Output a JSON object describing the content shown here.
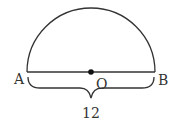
{
  "diagram": {
    "type": "semicircle",
    "labels": {
      "left_endpoint": "A",
      "right_endpoint": "B",
      "center": "O",
      "diameter_length": "12"
    },
    "colors": {
      "stroke": "#333333",
      "text": "#333333",
      "background": "#ffffff"
    }
  }
}
